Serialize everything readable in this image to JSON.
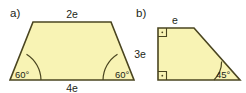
{
  "figure": {
    "background_color": "#ffffff",
    "fill_color": "#f8f3b4",
    "stroke_color": "#4a4520",
    "text_color": "#231f18"
  },
  "parts": [
    {
      "label": "a)",
      "shape": "isosceles-trapezoid",
      "sides": [
        {
          "name": "top",
          "text": "2e"
        },
        {
          "name": "bottom",
          "text": "4e"
        }
      ],
      "angles": [
        {
          "name": "bottom-left",
          "text": "60°"
        },
        {
          "name": "bottom-right",
          "text": "60°"
        }
      ]
    },
    {
      "label": "b)",
      "shape": "right-trapezoid",
      "sides": [
        {
          "name": "top",
          "text": "e"
        },
        {
          "name": "left",
          "text": "3e"
        }
      ],
      "angles": [
        {
          "name": "top-left",
          "text": ""
        },
        {
          "name": "bottom-left",
          "text": ""
        },
        {
          "name": "bottom-right",
          "text": "45°"
        }
      ],
      "right_angle_markers": 2
    }
  ]
}
